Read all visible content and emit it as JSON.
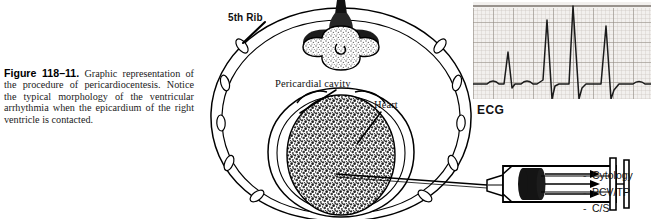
{
  "figure": {
    "number": "Figure 118–11.",
    "caption": "Graphic representation of the procedure of pericardiocentesis. Notice the typical morphology of the ventricular arrhythmia when the epicardium of the right ventricle is contacted."
  },
  "labels": {
    "rib": "5th Rib",
    "pericardial_cavity": "Pericardial cavity",
    "heart": "Heart",
    "ecg": "ECG"
  },
  "sample_list": {
    "bullet": "-",
    "items": [
      "Cytology",
      "PCV/TP",
      "C/S"
    ]
  },
  "ecg_trace": {
    "description": "Electrocardiogram strip showing ventricular arrhythmia morphology",
    "grid_background": "#f2f0ee",
    "grid_minor_color": "#c9c3bd",
    "grid_major_color": "#9a938c",
    "trace_color": "#1a1a1a",
    "complexes": 4,
    "minor_grid_px": 4,
    "major_grid_px": 20
  },
  "colors": {
    "ink": "#111111",
    "outline": "#000000",
    "heart_fill": "#6e6e6e",
    "vertebra_shade": "#b9b4ae",
    "paper": "#ffffff",
    "plunger": "#141414"
  },
  "anatomy": {
    "parts": [
      "thoracic-wall",
      "fifth-rib",
      "vertebra",
      "sternum",
      "pericardium",
      "pericardial-cavity",
      "heart",
      "needle",
      "syringe"
    ]
  }
}
